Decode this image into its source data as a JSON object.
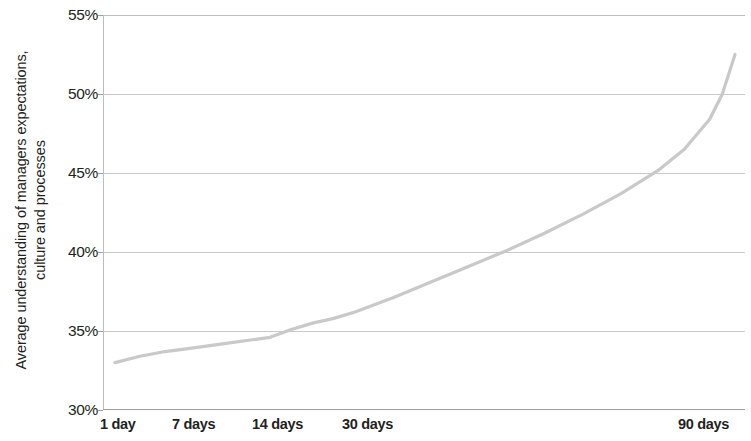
{
  "chart_data": {
    "type": "line",
    "title": "",
    "subtitle": "",
    "xlabel": "",
    "ylabel": "Average understanding of managers expectations, culture and processes",
    "ylabel_line1": "Average understanding of managers expectations,",
    "ylabel_line2": "culture and processes",
    "categories": [
      "1 day",
      "7 days",
      "14 days",
      "30 days",
      "90 days"
    ],
    "x": [
      1,
      7,
      14,
      30,
      90
    ],
    "series": [
      {
        "name": "Average understanding",
        "color": "#c9c9c9",
        "values": [
          33.0,
          33.9,
          34.6,
          36.2,
          52.5
        ],
        "points": [
          {
            "x": 1,
            "y": 33.0
          },
          {
            "x": 3,
            "y": 33.4
          },
          {
            "x": 5,
            "y": 33.7
          },
          {
            "x": 7,
            "y": 33.9
          },
          {
            "x": 10,
            "y": 34.2
          },
          {
            "x": 14,
            "y": 34.6
          },
          {
            "x": 18,
            "y": 35.1
          },
          {
            "x": 22,
            "y": 35.5
          },
          {
            "x": 26,
            "y": 35.8
          },
          {
            "x": 30,
            "y": 36.2
          },
          {
            "x": 36,
            "y": 37.1
          },
          {
            "x": 42,
            "y": 38.1
          },
          {
            "x": 48,
            "y": 39.1
          },
          {
            "x": 54,
            "y": 40.1
          },
          {
            "x": 60,
            "y": 41.2
          },
          {
            "x": 66,
            "y": 42.4
          },
          {
            "x": 72,
            "y": 43.7
          },
          {
            "x": 78,
            "y": 45.2
          },
          {
            "x": 82,
            "y": 46.5
          },
          {
            "x": 86,
            "y": 48.4
          },
          {
            "x": 88,
            "y": 50.0
          },
          {
            "x": 90,
            "y": 52.5
          }
        ]
      }
    ],
    "ylim": [
      30,
      55
    ],
    "yticks": [
      30,
      35,
      40,
      45,
      50,
      55
    ],
    "ytick_labels": [
      "30%",
      "35%",
      "40%",
      "45%",
      "50%",
      "55%"
    ],
    "xtick_labels": [
      "1 day",
      "7 days",
      "14 days",
      "30 days",
      "90 days"
    ],
    "grid": true,
    "grid_axis": "y",
    "legend": false,
    "legend_position": "none",
    "axis_color": "#bdbdbd",
    "grid_color": "#c9c9c9",
    "text_color": "#231f20"
  },
  "axes": {
    "y_ticks": [
      {
        "label": "55%",
        "value": 55
      },
      {
        "label": "50%",
        "value": 50
      },
      {
        "label": "45%",
        "value": 45
      },
      {
        "label": "40%",
        "value": 40
      },
      {
        "label": "35%",
        "value": 35
      },
      {
        "label": "30%",
        "value": 30
      }
    ],
    "x_ticks": [
      {
        "label": "1 day",
        "left_px": 100
      },
      {
        "label": "7 days",
        "left_px": 172
      },
      {
        "label": "14 days",
        "left_px": 252
      },
      {
        "label": "30 days",
        "left_px": 342
      },
      {
        "label": "90 days",
        "left_px": 678
      }
    ]
  }
}
